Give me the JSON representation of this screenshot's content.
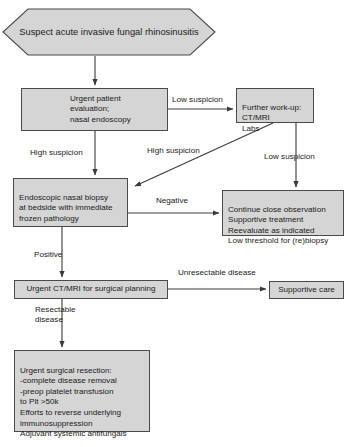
{
  "diagram": {
    "colors": {
      "node_fill": "#d5d5d5",
      "node_border": "#4a4a4a",
      "connector": "#3a3a3a",
      "background": "#ffffff",
      "text": "#1a1a1a"
    },
    "nodes": {
      "suspect": {
        "label": "Suspect acute invasive fungal rhinosinusitis",
        "shape": "hexagon"
      },
      "evaluation": {
        "label": "Urgent patient evaluation;\nnasal endoscopy",
        "shape": "rectangle"
      },
      "workup": {
        "label": "Further work-up:\nCT/MRI\nLabs",
        "shape": "rectangle"
      },
      "biopsy": {
        "label": "Endoscopic nasal biopsy\nat bedside with immediate\nfrozen pathology",
        "shape": "rectangle"
      },
      "observation": {
        "label": "Continue close observation\nSupportive treatment\nReevaluate as indicated\nLow threshold for (re)biopsy",
        "shape": "rectangle"
      },
      "imaging": {
        "label": "Urgent CT/MRI for surgical planning",
        "shape": "rectangle"
      },
      "supportive": {
        "label": "Supportive care",
        "shape": "rectangle"
      },
      "resection": {
        "label": "Urgent surgical resection:\n      -complete disease removal\n      -preop platelet transfusion\n       to Plt >50k\nEfforts to reverse underlying\nimmunosuppression\nAdjuvant systemic antifungals",
        "shape": "rectangle"
      }
    },
    "edges": [
      {
        "id": "suspect-to-evaluation",
        "label": ""
      },
      {
        "id": "evaluation-to-workup",
        "label": "Low suspicion"
      },
      {
        "id": "evaluation-to-biopsy",
        "label": "High suspicion"
      },
      {
        "id": "workup-to-biopsy",
        "label": "High suspicion"
      },
      {
        "id": "workup-to-observation",
        "label": "Low suspicion"
      },
      {
        "id": "biopsy-to-observation",
        "label": "Negative"
      },
      {
        "id": "biopsy-to-imaging",
        "label": "Positive"
      },
      {
        "id": "imaging-to-supportive",
        "label": "Unresectable disease"
      },
      {
        "id": "imaging-to-resection",
        "label": "Resectable\ndisease"
      }
    ]
  }
}
